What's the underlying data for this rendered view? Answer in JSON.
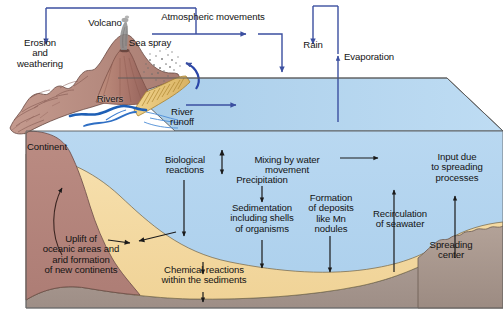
{
  "figure": {
    "colors": {
      "ocean": "#b3d4ef",
      "continent_rock": "#b5847c",
      "sediment_tan": "#f5dba5",
      "basement_gray": "#a89890",
      "coastal_green": "#bcd0b4",
      "arrow_blue": "#3b4fa0",
      "arrow_dark": "#1a1a1a",
      "outline": "#4a4a4a",
      "beach_sand": "#e8c77a",
      "river_blue": "#2f6fc4",
      "volcano_rock": "#b07b6e",
      "text": "#131313",
      "background": "#ffffff"
    }
  },
  "labels": {
    "volcano": "Volcano",
    "sea_spray": "Sea spray",
    "atmospheric_movements": "Atmospheric movements",
    "rain": "Rain",
    "evaporation": "Evaporation",
    "erosion_and_weathering": "Erosion\nand\nweathering",
    "rivers": "Rivers",
    "river_runoff": "River\nrunoff",
    "continent": "Continent",
    "biological_reactions": "Biological\nreactions",
    "mixing_by_water_movement": "Mixing by water movement",
    "precipitation": "Precipitation",
    "sedimentation": "Sedimentation\nincluding shells\nof organisms",
    "formation_of_deposits": "Formation\nof deposits\nlike Mn\nnodules",
    "recirculation_of_seawater": "Recirculation\nof seawater",
    "input_due_to_spreading": "Input due\nto spreading\nprocesses",
    "spreading_center": "Spreading\ncenter",
    "uplift": "Uplift of\noceanic areas and\narid formation\nof new continents",
    "chemical_reactions": "Chemical reactions\nwithin the sediments"
  }
}
